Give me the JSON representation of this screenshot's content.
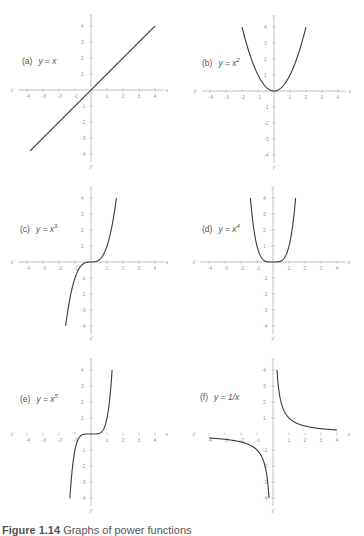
{
  "figure": {
    "caption_label": "Figure 1.14",
    "caption_text": "Graphs of power functions"
  },
  "chart_data": [
    {
      "id": "a",
      "type": "line",
      "label": "(a)",
      "equation": "y = x",
      "power": "",
      "func": "x",
      "origin": [
        91,
        90
      ],
      "unit": 16,
      "x": [
        -4,
        -3,
        -2,
        -1,
        0,
        1,
        2,
        3,
        4
      ],
      "y": [
        -4,
        -3,
        -2,
        -1,
        0,
        1,
        2,
        3,
        4
      ],
      "xlim": [
        -4,
        4
      ],
      "ylim": [
        -4,
        4
      ],
      "xticks": [
        -4,
        -3,
        -2,
        -1,
        1,
        2,
        3,
        4
      ],
      "yticks": [
        -4,
        -3,
        -2,
        -1,
        1,
        2,
        3,
        4
      ],
      "xlabel": "x",
      "ylabel": "y",
      "draw_x_axis_line": true,
      "domain": [
        -3.8,
        4
      ]
    },
    {
      "id": "b",
      "type": "line",
      "label": "(b)",
      "equation": "y = x",
      "power": "2",
      "func": "x2",
      "origin": [
        274,
        91
      ],
      "unit": 16,
      "x": [
        -2,
        -1,
        0,
        1,
        2
      ],
      "y": [
        4,
        1,
        0,
        1,
        4
      ],
      "xlim": [
        -4,
        4
      ],
      "ylim": [
        -4,
        4
      ],
      "xticks": [
        -4,
        -3,
        -2,
        -1,
        1,
        2,
        3,
        4
      ],
      "yticks": [
        -4,
        -3,
        -2,
        -1,
        1,
        2,
        3,
        4
      ],
      "xlabel": "x",
      "ylabel": "y",
      "draw_x_axis_line": true,
      "domain": [
        -2,
        2
      ]
    },
    {
      "id": "c",
      "type": "line",
      "label": "(c)",
      "equation": "y = x",
      "power": "3",
      "func": "x3",
      "origin": [
        91,
        262
      ],
      "unit": 16,
      "x": [
        -1.6,
        -1,
        0,
        1,
        1.6
      ],
      "y": [
        -4,
        -1,
        0,
        1,
        4
      ],
      "xlim": [
        -4,
        4
      ],
      "ylim": [
        -4,
        4
      ],
      "xticks": [
        -4,
        -3,
        -2,
        -1,
        1,
        2,
        3,
        4
      ],
      "yticks": [
        -4,
        -3,
        -2,
        -1,
        1,
        2,
        3,
        4
      ],
      "xlabel": "x",
      "ylabel": "y",
      "draw_x_axis_line": true,
      "domain": [
        -1.587,
        1.587
      ]
    },
    {
      "id": "d",
      "type": "line",
      "label": "(d)",
      "equation": "y = x",
      "power": "4",
      "func": "x4",
      "origin": [
        273,
        262
      ],
      "unit": 16,
      "x": [
        -1.4,
        -1,
        0,
        1,
        1.4
      ],
      "y": [
        4,
        1,
        0,
        1,
        4
      ],
      "xlim": [
        -4,
        4
      ],
      "ylim": [
        -4,
        4
      ],
      "xticks": [
        -4,
        -3,
        -2,
        -1,
        1,
        2,
        3,
        4
      ],
      "yticks": [
        -4,
        -3,
        -2,
        -1,
        1,
        2,
        3,
        4
      ],
      "xlabel": "x",
      "ylabel": "y",
      "draw_x_axis_line": true,
      "domain": [
        -1.414,
        1.414
      ]
    },
    {
      "id": "e",
      "type": "line",
      "label": "(e)",
      "equation": "y = x",
      "power": "5",
      "func": "x5",
      "origin": [
        91,
        434
      ],
      "unit": 16,
      "x": [
        -1.3,
        -1,
        0,
        1,
        1.3
      ],
      "y": [
        -4,
        -1,
        0,
        1,
        4
      ],
      "xlim": [
        -4,
        4
      ],
      "ylim": [
        -4,
        4
      ],
      "xticks": [
        -4,
        -3,
        -2,
        -1,
        1,
        2,
        3,
        4
      ],
      "yticks": [
        -4,
        -3,
        -2,
        -1,
        1,
        2,
        3,
        4
      ],
      "xlabel": "x",
      "ylabel": "y",
      "draw_x_axis_line": false,
      "domain": [
        -1.32,
        1.32
      ]
    },
    {
      "id": "f",
      "type": "line",
      "label": "(f)",
      "equation": "y = 1/x",
      "power": "",
      "func": "inv",
      "origin": [
        273,
        434
      ],
      "unit": 16,
      "x": [
        -4,
        -2,
        -1,
        -0.5,
        -0.25,
        0.25,
        0.5,
        1,
        2,
        4
      ],
      "y": [
        -0.25,
        -0.5,
        -1,
        -2,
        -4,
        4,
        2,
        1,
        0.5,
        0.25
      ],
      "xlim": [
        -4,
        4
      ],
      "ylim": [
        -4,
        4
      ],
      "xticks": [
        -4,
        -3,
        -2,
        -1,
        1,
        2,
        3,
        4
      ],
      "yticks": [
        -4,
        -3,
        -2,
        -1,
        1,
        2,
        3,
        4
      ],
      "xlabel": "x",
      "ylabel": "y",
      "draw_x_axis_line": false,
      "domain": [
        -4,
        4
      ]
    }
  ],
  "colors": {
    "curve": "#3a3a3a",
    "axis": "#9a9a9a",
    "tick_text": "#a0a0a0",
    "label": "#555555"
  }
}
